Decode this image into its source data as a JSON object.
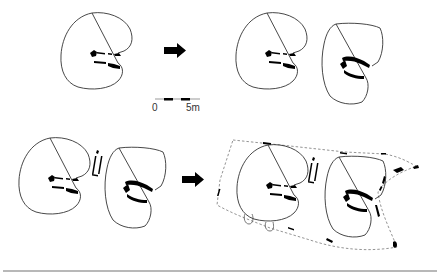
{
  "figure": {
    "stages": [
      {
        "id": "stage-1",
        "label": "single structure"
      },
      {
        "id": "stage-2",
        "label": "two structures"
      },
      {
        "id": "stage-3",
        "label": "two structures with intervening features"
      },
      {
        "id": "stage-4",
        "label": "structures within dashed enclosure"
      }
    ]
  },
  "scale_bar": {
    "start_label": "0",
    "end_label": "5m"
  },
  "colors": {
    "outline": "#333333",
    "fill_marks": "#000000",
    "dashed": "#888888",
    "rule": "#b8b8b8",
    "background": "#ffffff"
  }
}
